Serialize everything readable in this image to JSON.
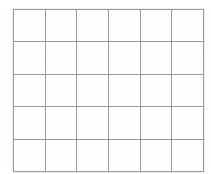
{
  "document": {
    "type": "grid-table",
    "title": "Blank grid",
    "background_color": "#ffffff",
    "line_color": "#9a9a9a",
    "line_width_px": 1.4,
    "columns": 6,
    "rows": 5,
    "bounds": {
      "left": 13,
      "top": 9,
      "right": 197,
      "bottom": 166
    },
    "cell_width_px": 30.7,
    "cell_height_px": 31.4,
    "cells_empty": true
  },
  "chart_data": {
    "type": "table",
    "title": "",
    "columns": [
      "",
      "",
      "",
      "",
      "",
      ""
    ],
    "rows": [
      [
        "",
        "",
        "",
        "",
        "",
        ""
      ],
      [
        "",
        "",
        "",
        "",
        "",
        ""
      ],
      [
        "",
        "",
        "",
        "",
        "",
        ""
      ],
      [
        "",
        "",
        "",
        "",
        "",
        ""
      ],
      [
        "",
        "",
        "",
        "",
        "",
        ""
      ]
    ],
    "grid": true,
    "legend": "none"
  }
}
